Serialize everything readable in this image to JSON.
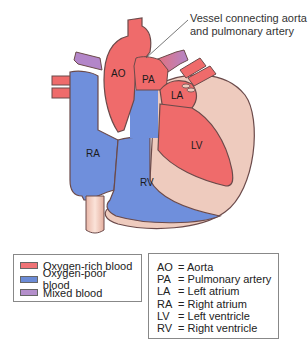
{
  "diagram": {
    "title_callout": [
      "Vessel connecting aorta",
      "and pulmonary artery"
    ],
    "chamber_labels": {
      "AO": "AO",
      "PA": "PA",
      "LA": "LA",
      "RA": "RA",
      "LV": "LV",
      "RV": "RV"
    },
    "colors": {
      "oxygen_rich": "#ef6b6b",
      "oxygen_poor": "#6f8fdc",
      "mixed": "#b386c9",
      "tissue": "#eecbbe",
      "outline": "#6b4a4a"
    }
  },
  "legend": {
    "items": [
      {
        "label": "Oxygen-rich blood",
        "color": "#ef7376"
      },
      {
        "label": "Oxygen-poor blood",
        "color": "#6b8bd6"
      },
      {
        "label": "Mixed blood",
        "color": "#b48fcb"
      }
    ]
  },
  "abbreviations": {
    "items": [
      {
        "abbr": "AO",
        "sep": "=",
        "meaning": "Aorta"
      },
      {
        "abbr": "PA",
        "sep": "=",
        "meaning": "Pulmonary artery"
      },
      {
        "abbr": "LA",
        "sep": "=",
        "meaning": "Left atrium"
      },
      {
        "abbr": "RA",
        "sep": "=",
        "meaning": "Right atrium"
      },
      {
        "abbr": "LV",
        "sep": "=",
        "meaning": "Left ventricle"
      },
      {
        "abbr": "RV",
        "sep": "=",
        "meaning": "Right ventricle"
      }
    ]
  }
}
